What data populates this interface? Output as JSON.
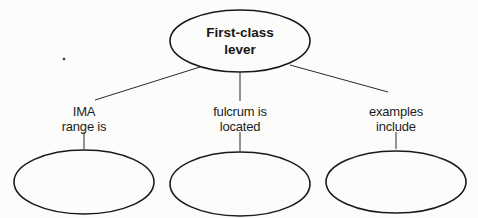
{
  "diagram": {
    "type": "concept-map",
    "root": {
      "line1": "First-class",
      "line2": "lever"
    },
    "branches": [
      {
        "label_line1": "IMA",
        "label_line2": "range is",
        "answer": ""
      },
      {
        "label_line1": "fulcrum is",
        "label_line2": "located",
        "answer": ""
      },
      {
        "label_line1": "examples",
        "label_line2": "include",
        "answer": ""
      }
    ],
    "colors": {
      "background": "#fcfcfa",
      "stroke": "#1a1a1a",
      "text": "#1a1a1a"
    }
  }
}
